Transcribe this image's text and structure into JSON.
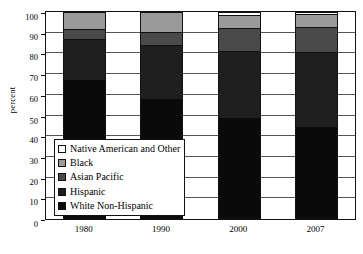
{
  "chart_data": {
    "type": "bar",
    "subtype": "stacked-100-percent",
    "title": "",
    "xlabel": "",
    "ylabel": "percent",
    "categories": [
      "1980",
      "1990",
      "2000",
      "2007"
    ],
    "ylim": [
      0,
      100
    ],
    "yticks": [
      0,
      10,
      20,
      30,
      40,
      50,
      60,
      70,
      80,
      90,
      100
    ],
    "grid": true,
    "legend_position": "inside-lower-left",
    "stack_order_bottom_to_top": [
      "White Non-Hispanic",
      "Hispanic",
      "Asian Pacific",
      "Black",
      "Native American and Other"
    ],
    "series": [
      {
        "name": "White Non-Hispanic",
        "color": "#0a0a0a",
        "values": [
          67.0,
          58.0,
          49.0,
          44.5
        ]
      },
      {
        "name": "Hispanic",
        "color": "#1f1f1f",
        "values": [
          20.0,
          26.0,
          32.0,
          36.0
        ]
      },
      {
        "name": "Asian Pacific",
        "color": "#4a4a4a",
        "values": [
          5.0,
          6.5,
          11.5,
          12.5
        ]
      },
      {
        "name": "Black",
        "color": "#9a9a9a",
        "values": [
          8.0,
          9.5,
          6.0,
          6.0
        ]
      },
      {
        "name": "Native American and Other",
        "color": "#ffffff",
        "values": [
          0.0,
          0.0,
          1.5,
          1.0
        ]
      }
    ],
    "cumulative_tops": {
      "1980": [
        67.0,
        87.0,
        92.0,
        100.0,
        100.0
      ],
      "1990": [
        58.0,
        84.0,
        90.5,
        100.0,
        100.0
      ],
      "2000": [
        49.0,
        81.0,
        92.5,
        98.5,
        100.0
      ],
      "2007": [
        44.5,
        80.5,
        93.0,
        99.0,
        100.0
      ]
    }
  },
  "legend": {
    "items": [
      {
        "label": "Native American and Other",
        "color": "#ffffff"
      },
      {
        "label": "Black",
        "color": "#9a9a9a"
      },
      {
        "label": "Asian Pacific",
        "color": "#4a4a4a"
      },
      {
        "label": "Hispanic",
        "color": "#1f1f1f"
      },
      {
        "label": "White Non-Hispanic",
        "color": "#0a0a0a"
      }
    ]
  }
}
